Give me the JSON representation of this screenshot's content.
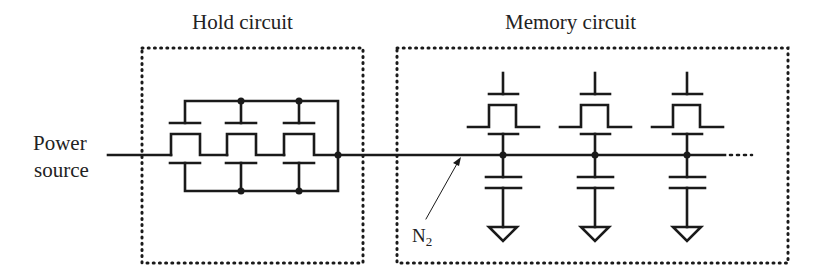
{
  "diagram": {
    "type": "circuit-schematic",
    "colors": {
      "line": "#1a1a1a",
      "text": "#222222",
      "background": "#ffffff"
    },
    "blocks": [
      {
        "id": "hold",
        "title": "Hold circuit",
        "transistor_count": 3,
        "topology": "parallel transistors with gates tied to top rail and bottom terminals tied to bottom rail"
      },
      {
        "id": "memory",
        "title": "Memory circuit",
        "cell_count": 3,
        "cell": "transistor + capacitor to ground",
        "continues": true
      }
    ],
    "labels": {
      "power_line1": "Power",
      "power_line2": "source",
      "hold_title": "Hold circuit",
      "memory_title": "Memory circuit",
      "node_main": "N",
      "node_sub": "2"
    },
    "annotations": [
      {
        "text": "N2",
        "points_to": "shared line entering memory circuit"
      }
    ],
    "continuation": "..."
  }
}
